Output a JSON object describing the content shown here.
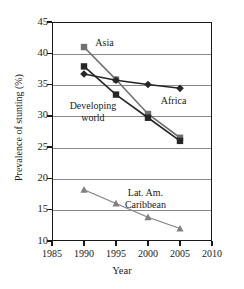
{
  "chart_data": {
    "type": "line",
    "title": "",
    "xlabel": "Year",
    "ylabel": "Prevalence of stunting (%)",
    "xlim": [
      1985,
      2010
    ],
    "ylim": [
      10,
      45
    ],
    "xticks": [
      1985,
      1990,
      1995,
      2000,
      2005,
      2010
    ],
    "yticks": [
      10,
      15,
      20,
      25,
      30,
      35,
      40,
      45
    ],
    "grid": "horizontal",
    "legend": "inline-labels",
    "x": [
      1990,
      1995,
      2000,
      2005
    ],
    "series": [
      {
        "name": "Asia",
        "marker": "square",
        "color": "#707070",
        "values": [
          41.0,
          35.8,
          30.3,
          26.5
        ]
      },
      {
        "name": "Developing world",
        "marker": "square",
        "color": "#262626",
        "values": [
          37.9,
          33.4,
          29.7,
          26.0
        ]
      },
      {
        "name": "Africa",
        "marker": "diamond",
        "color": "#262626",
        "values": [
          36.7,
          35.7,
          35.0,
          34.4
        ]
      },
      {
        "name": "Lat. Am. Caribbean",
        "marker": "triangle",
        "color": "#808080",
        "values": [
          18.2,
          16.0,
          13.8,
          12.0
        ]
      }
    ]
  },
  "labels": {
    "asia": "Asia",
    "developing_line1": "Developing",
    "developing_line2": "world",
    "africa": "Africa",
    "lac_line1": "Lat. Am.",
    "lac_line2": "Caribbean"
  },
  "colors": {
    "axis": "#1a1a1a",
    "grid": "#8a8a8a",
    "asia": "#707070",
    "developing": "#262626",
    "africa": "#262626",
    "lac": "#808080",
    "background": "#ffffff"
  }
}
